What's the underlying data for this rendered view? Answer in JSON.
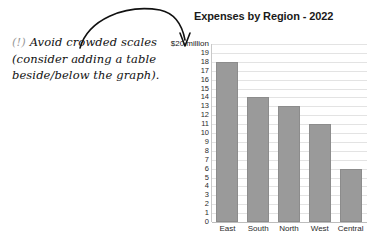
{
  "annotation": {
    "marker": "(!)",
    "lines": [
      "Avoid crowded scales",
      "(consider adding a table",
      "beside/below the graph)."
    ]
  },
  "chart_data": {
    "type": "bar",
    "title": "Expenses by Region - 2022",
    "categories": [
      "East",
      "South",
      "North",
      "West",
      "Central"
    ],
    "values": [
      18,
      14,
      13,
      11,
      6
    ],
    "xlabel": "",
    "ylabel": "",
    "unit_label": "$20 million",
    "ylim": [
      0,
      20
    ],
    "ytick_labels": [
      "$20 million",
      "19",
      "18",
      "17",
      "16",
      "15",
      "14",
      "13",
      "12",
      "11",
      "10",
      "9",
      "8",
      "7",
      "6",
      "5",
      "4",
      "3",
      "2",
      "1",
      "0"
    ],
    "ytick_values": [
      20,
      19,
      18,
      17,
      16,
      15,
      14,
      13,
      12,
      11,
      10,
      9,
      8,
      7,
      6,
      5,
      4,
      3,
      2,
      1,
      0
    ],
    "grid": true,
    "legend": false,
    "bar_color": "#9a9a9a",
    "grid_color": "#e3e3e3",
    "title_color": "#1a1a1a"
  }
}
